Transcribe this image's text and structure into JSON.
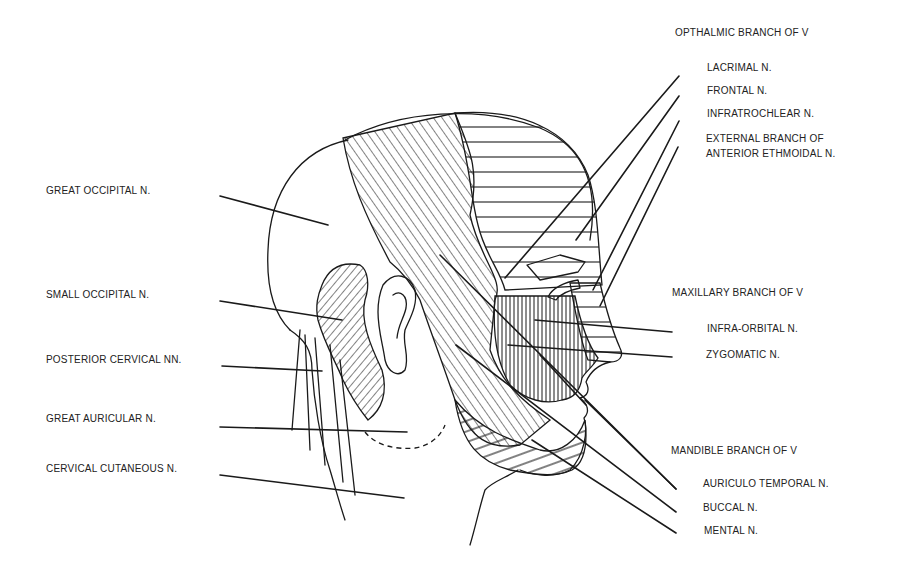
{
  "figure": {
    "colors": {
      "ink": "#1a1a1a",
      "background": "#ffffff"
    }
  },
  "labels": {
    "left": [
      {
        "id": "great-occipital",
        "text": "GREAT OCCIPITAL N.",
        "x": 46,
        "y": 191
      },
      {
        "id": "small-occipital",
        "text": "SMALL OCCIPITAL N.",
        "x": 46,
        "y": 295
      },
      {
        "id": "posterior-cervical",
        "text": "POSTERIOR CERVICAL NN.",
        "x": 46,
        "y": 360
      },
      {
        "id": "great-auricular",
        "text": "GREAT AURICULAR N.",
        "x": 46,
        "y": 419
      },
      {
        "id": "cervical-cutaneous",
        "text": "CERVICAL CUTANEOUS N.",
        "x": 46,
        "y": 469
      }
    ],
    "ophthalmic": {
      "heading": {
        "text": "OPTHALMIC BRANCH OF V",
        "x": 675,
        "y": 33
      },
      "items": [
        {
          "id": "lacrimal",
          "text": "LACRIMAL N.",
          "x": 707,
          "y": 68
        },
        {
          "id": "frontal",
          "text": "FRONTAL N.",
          "x": 707,
          "y": 91
        },
        {
          "id": "infratrochlear",
          "text": "INFRATROCHLEAR N.",
          "x": 707,
          "y": 114
        },
        {
          "id": "external-branch-anterior-ethmoidal",
          "text": "EXTERNAL BRANCH OF\nANTERIOR ETHMOIDAL N.",
          "x": 706,
          "y": 137
        }
      ]
    },
    "maxillary": {
      "heading": {
        "text": "MAXILLARY BRANCH OF V",
        "x": 672,
        "y": 293
      },
      "items": [
        {
          "id": "infra-orbital",
          "text": "INFRA-ORBITAL N.",
          "x": 707,
          "y": 329
        },
        {
          "id": "zygomatic",
          "text": "ZYGOMATIC N.",
          "x": 706,
          "y": 355
        }
      ]
    },
    "mandibular": {
      "heading": {
        "text": "MANDIBLE BRANCH OF V",
        "x": 671,
        "y": 451
      },
      "items": [
        {
          "id": "auriculo-temporal",
          "text": "AURICULO TEMPORAL N.",
          "x": 703,
          "y": 484
        },
        {
          "id": "buccal",
          "text": "BUCCAL N.",
          "x": 703,
          "y": 508
        },
        {
          "id": "mental",
          "text": "MENTAL N.",
          "x": 704,
          "y": 531
        }
      ]
    }
  },
  "leaders": [
    {
      "for": "great-occipital",
      "x1": 220,
      "y1": 196,
      "x2": 328,
      "y2": 225
    },
    {
      "for": "small-occipital",
      "x1": 220,
      "y1": 301,
      "x2": 342,
      "y2": 320
    },
    {
      "for": "posterior-cervical",
      "x1": 222,
      "y1": 366,
      "x2": 322,
      "y2": 371
    },
    {
      "for": "great-auricular",
      "x1": 220,
      "y1": 427,
      "x2": 407,
      "y2": 432
    },
    {
      "for": "cervical-cutaneous",
      "x1": 220,
      "y1": 475,
      "x2": 404,
      "y2": 498
    },
    {
      "for": "lacrimal",
      "x1": 679,
      "y1": 76,
      "x2": 505,
      "y2": 278
    },
    {
      "for": "frontal",
      "x1": 679,
      "y1": 96,
      "x2": 576,
      "y2": 240
    },
    {
      "for": "infratrochlear",
      "x1": 679,
      "y1": 121,
      "x2": 593,
      "y2": 290
    },
    {
      "for": "external-branch-anterior-ethmoidal",
      "x1": 678,
      "y1": 147,
      "x2": 600,
      "y2": 306
    },
    {
      "for": "infra-orbital",
      "x1": 672,
      "y1": 332,
      "x2": 535,
      "y2": 320
    },
    {
      "for": "zygomatic",
      "x1": 672,
      "y1": 357,
      "x2": 508,
      "y2": 345
    },
    {
      "for": "auriculo-temporal",
      "x1": 676,
      "y1": 489,
      "x2": 440,
      "y2": 255
    },
    {
      "for": "buccal",
      "x1": 676,
      "y1": 512,
      "x2": 456,
      "y2": 345
    },
    {
      "for": "mental",
      "x1": 676,
      "y1": 533,
      "x2": 532,
      "y2": 440
    },
    {
      "for": "mandible-inner-1",
      "x1": 586,
      "y1": 405,
      "x2": 540,
      "y2": 355
    },
    {
      "for": "mandible-inner-2",
      "x1": 676,
      "y1": 489,
      "x2": 585,
      "y2": 400
    }
  ]
}
